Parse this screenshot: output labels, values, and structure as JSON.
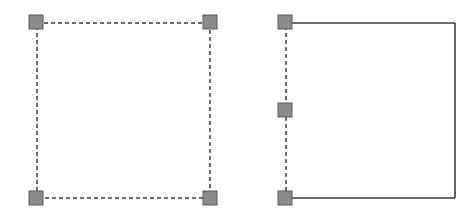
{
  "figures": [
    {
      "name": "rectangle-all-edges-selected",
      "edges": [
        {
          "x1": 37,
          "y1": 23,
          "x2": 210,
          "y2": 23,
          "style": "dashed"
        },
        {
          "x1": 210,
          "y1": 23,
          "x2": 210,
          "y2": 198,
          "style": "dashed"
        },
        {
          "x1": 210,
          "y1": 198,
          "x2": 37,
          "y2": 198,
          "style": "dashed"
        },
        {
          "x1": 37,
          "y1": 198,
          "x2": 37,
          "y2": 23,
          "style": "dashed"
        }
      ],
      "handles": [
        {
          "cx": 36,
          "cy": 22
        },
        {
          "cx": 210,
          "cy": 22
        },
        {
          "cx": 36,
          "cy": 198
        },
        {
          "cx": 210,
          "cy": 198
        }
      ]
    },
    {
      "name": "rectangle-left-edge-selected",
      "edges": [
        {
          "x1": 286,
          "y1": 23,
          "x2": 455,
          "y2": 23,
          "style": "solid"
        },
        {
          "x1": 455,
          "y1": 23,
          "x2": 455,
          "y2": 198,
          "style": "solid"
        },
        {
          "x1": 455,
          "y1": 198,
          "x2": 286,
          "y2": 198,
          "style": "solid"
        },
        {
          "x1": 286,
          "y1": 198,
          "x2": 286,
          "y2": 23,
          "style": "dashed"
        }
      ],
      "handles": [
        {
          "cx": 285,
          "cy": 22
        },
        {
          "cx": 285,
          "cy": 110
        },
        {
          "cx": 285,
          "cy": 198
        }
      ]
    }
  ],
  "colors": {
    "line": "#3a3a3a",
    "handle_fill": "#8a8a8a",
    "handle_stroke": "#5a5a5a",
    "background": "#ffffff"
  },
  "handle_size": 14
}
